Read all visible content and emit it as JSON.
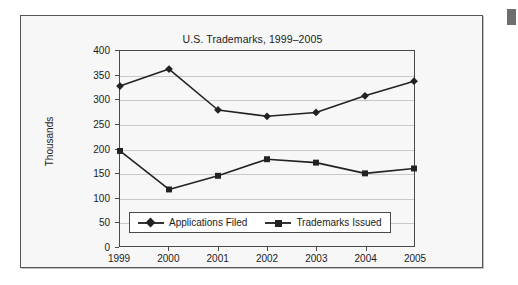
{
  "chart_data": {
    "type": "line",
    "title": "U.S. Trademarks, 1999–2005",
    "xlabel": "",
    "ylabel": "Thousands",
    "categories": [
      "1999",
      "2000",
      "2001",
      "2002",
      "2003",
      "2004",
      "2005"
    ],
    "ylim": [
      0,
      400
    ],
    "yticks": [
      "0",
      "50",
      "100",
      "150",
      "200",
      "250",
      "300",
      "350",
      "400"
    ],
    "ytick_values": [
      0,
      50,
      100,
      150,
      200,
      250,
      300,
      350,
      400
    ],
    "grid": true,
    "legend_position": "inside-bottom-left",
    "series": [
      {
        "name": "Applications Filed",
        "marker": "diamond",
        "color": "#222222",
        "values": [
          328,
          363,
          279,
          266,
          274,
          308,
          338
        ]
      },
      {
        "name": "Trademarks Issued",
        "marker": "square",
        "color": "#222222",
        "values": [
          195,
          116,
          144,
          178,
          171,
          149,
          159
        ]
      }
    ]
  },
  "figure": {
    "panel_background": "#f7f7f7",
    "border_color": "#555555",
    "gridline_color": "#c9c9c9",
    "axis_color": "#4a4a4a"
  },
  "artifact": {
    "label": "page-edge-marker"
  }
}
